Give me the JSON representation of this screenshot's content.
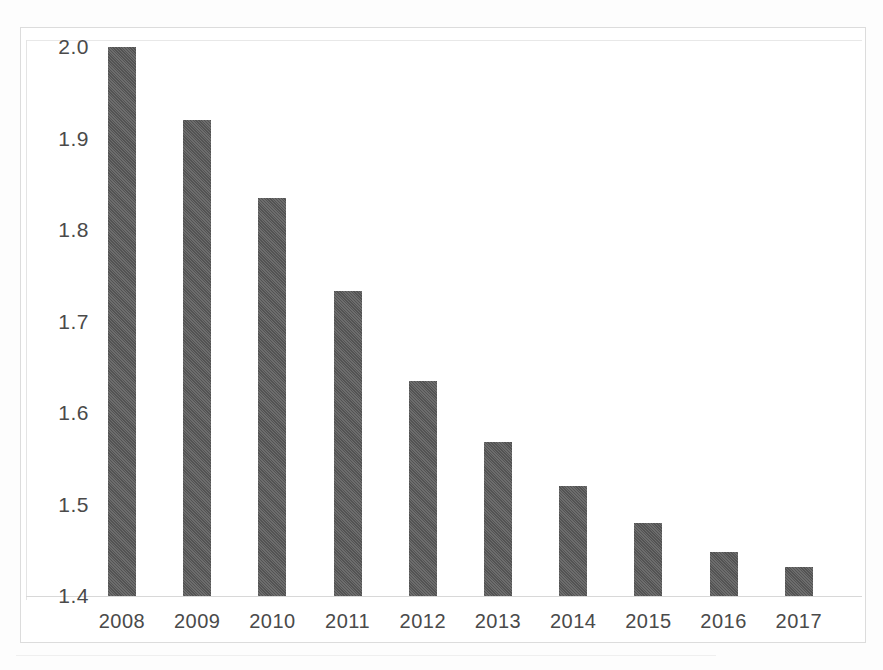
{
  "chart_data": {
    "type": "bar",
    "title": "",
    "subtitle": "",
    "xlabel": "",
    "ylabel": "",
    "categories": [
      "2008",
      "2009",
      "2010",
      "2011",
      "2012",
      "2013",
      "2014",
      "2015",
      "2016",
      "2017"
    ],
    "values": [
      2.0,
      1.92,
      1.835,
      1.733,
      1.635,
      1.568,
      1.52,
      1.48,
      1.448,
      1.432
    ],
    "series": [
      {
        "name": "",
        "values": [
          2.0,
          1.92,
          1.835,
          1.733,
          1.635,
          1.568,
          1.52,
          1.48,
          1.448,
          1.432
        ]
      }
    ],
    "ylim": [
      1.4,
      2.0
    ],
    "y_ticks": [
      1.4,
      1.5,
      1.6,
      1.7,
      1.8,
      1.9,
      2.0
    ],
    "y_tick_labels": [
      "1.4",
      "1.5",
      "1.6",
      "1.7",
      "1.8",
      "1.9",
      "2.0"
    ],
    "x_tick_labels": [
      "2008",
      "2009",
      "2010",
      "2011",
      "2012",
      "2013",
      "2014",
      "2015",
      "2016",
      "2017"
    ],
    "grid": false,
    "legend": false,
    "legend_position": "none",
    "bar_color": "#595959",
    "axis_color": "#d8d8d8",
    "frame_color": "#dcdcdc",
    "text_color": "#4a4a4a",
    "background": "#ffffff",
    "annotations": []
  }
}
